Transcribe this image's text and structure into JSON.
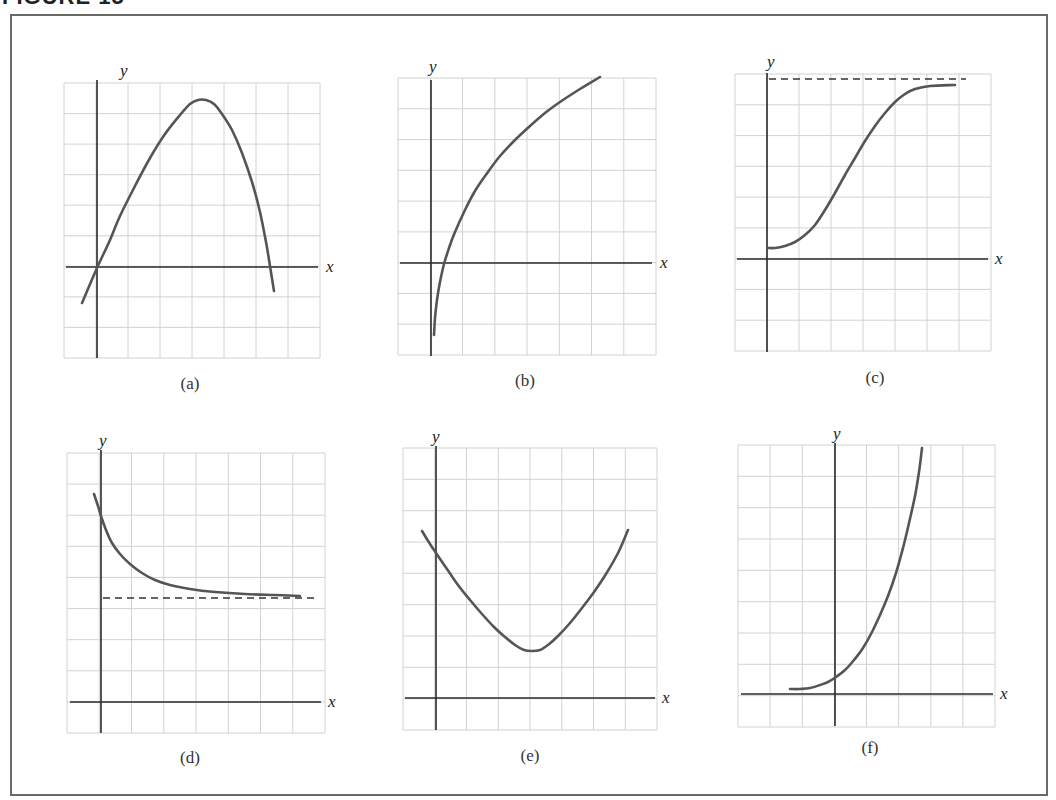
{
  "figure": {
    "title": "FIGURE 15",
    "axis_x_label": "x",
    "axis_y_label": "y",
    "colors": {
      "grid": "#d2d2d2",
      "axis": "#2a2a2a",
      "curve": "#555555",
      "dashed": "#333333",
      "caption": "#333333"
    }
  },
  "panels": [
    {
      "id": "a",
      "caption": "(a)",
      "grid": {
        "left": 64,
        "top": 83,
        "right": 320,
        "bottom": 358,
        "cols": 8,
        "rows": 9
      },
      "axes": {
        "yx": 97,
        "xy": 267,
        "xend": 318,
        "ytop": 80,
        "ybottom": 358,
        "xstart": 66
      },
      "labels": {
        "y": [
          120,
          76
        ],
        "x": [
          326,
          272
        ]
      },
      "caption_pos": [
        190,
        388
      ],
      "curve": [
        [
          82,
          303
        ],
        [
          97,
          268
        ],
        [
          110,
          240
        ],
        [
          120,
          216
        ],
        [
          135,
          186
        ],
        [
          150,
          158
        ],
        [
          165,
          134
        ],
        [
          180,
          115
        ],
        [
          190,
          104
        ],
        [
          198,
          100
        ],
        [
          206,
          100
        ],
        [
          214,
          104
        ],
        [
          222,
          114
        ],
        [
          232,
          130
        ],
        [
          242,
          153
        ],
        [
          252,
          182
        ],
        [
          260,
          212
        ],
        [
          266,
          242
        ],
        [
          270,
          266
        ],
        [
          274,
          291
        ]
      ]
    },
    {
      "id": "b",
      "caption": "(b)",
      "grid": {
        "left": 398,
        "top": 78,
        "right": 656,
        "bottom": 355,
        "cols": 8,
        "rows": 9
      },
      "axes": {
        "yx": 431,
        "xy": 263,
        "xend": 652,
        "ytop": 80,
        "ybottom": 356,
        "xstart": 400
      },
      "labels": {
        "y": [
          429,
          72
        ],
        "x": [
          660,
          268
        ]
      },
      "caption_pos": [
        525,
        385
      ],
      "curve": [
        [
          434,
          335
        ],
        [
          435,
          318
        ],
        [
          437,
          300
        ],
        [
          440,
          282
        ],
        [
          444,
          264
        ],
        [
          449,
          248
        ],
        [
          455,
          232
        ],
        [
          465,
          210
        ],
        [
          475,
          191
        ],
        [
          488,
          172
        ],
        [
          500,
          156
        ],
        [
          515,
          140
        ],
        [
          530,
          126
        ],
        [
          545,
          113
        ],
        [
          560,
          102
        ],
        [
          580,
          89
        ],
        [
          600,
          77
        ]
      ]
    },
    {
      "id": "c",
      "caption": "(c)",
      "grid": {
        "left": 735,
        "top": 74,
        "right": 991,
        "bottom": 351,
        "cols": 8,
        "rows": 9
      },
      "axes": {
        "yx": 767,
        "xy": 259,
        "xend": 988,
        "ytop": 73,
        "ybottom": 352,
        "xstart": 737
      },
      "labels": {
        "y": [
          767,
          67
        ],
        "x": [
          995,
          264
        ]
      },
      "caption_pos": [
        875,
        382
      ],
      "dashed": {
        "x1": 769,
        "x2": 966,
        "y": 79
      },
      "curve": [
        [
          768,
          248
        ],
        [
          775,
          248
        ],
        [
          785,
          246
        ],
        [
          795,
          242
        ],
        [
          805,
          235
        ],
        [
          815,
          225
        ],
        [
          825,
          210
        ],
        [
          835,
          193
        ],
        [
          845,
          175
        ],
        [
          855,
          158
        ],
        [
          865,
          141
        ],
        [
          875,
          126
        ],
        [
          885,
          113
        ],
        [
          895,
          102
        ],
        [
          905,
          94
        ],
        [
          915,
          89
        ],
        [
          930,
          86
        ],
        [
          955,
          85
        ]
      ]
    },
    {
      "id": "d",
      "caption": "(d)",
      "grid": {
        "left": 67,
        "top": 453,
        "right": 325,
        "bottom": 733,
        "cols": 8,
        "rows": 9
      },
      "axes": {
        "yx": 101,
        "xy": 702,
        "xend": 321,
        "ytop": 450,
        "ybottom": 733,
        "xstart": 70
      },
      "labels": {
        "y": [
          99,
          446
        ],
        "x": [
          328,
          707
        ]
      },
      "caption_pos": [
        190,
        762
      ],
      "dashed": {
        "x1": 103,
        "x2": 314,
        "y": 598
      },
      "curve": [
        [
          94,
          494
        ],
        [
          98,
          506
        ],
        [
          101,
          516
        ],
        [
          106,
          530
        ],
        [
          112,
          543
        ],
        [
          120,
          554
        ],
        [
          130,
          564
        ],
        [
          142,
          573
        ],
        [
          155,
          580
        ],
        [
          170,
          585
        ],
        [
          190,
          589
        ],
        [
          215,
          592
        ],
        [
          245,
          594
        ],
        [
          275,
          595
        ],
        [
          300,
          596
        ]
      ]
    },
    {
      "id": "e",
      "caption": "(e)",
      "grid": {
        "left": 403,
        "top": 448,
        "right": 657,
        "bottom": 730,
        "cols": 8,
        "rows": 9
      },
      "axes": {
        "yx": 436,
        "xy": 698,
        "xend": 655,
        "ytop": 446,
        "ybottom": 730,
        "xstart": 405
      },
      "labels": {
        "y": [
          432,
          442
        ],
        "x": [
          662,
          703
        ]
      },
      "caption_pos": [
        530,
        760
      ],
      "curve": [
        [
          422,
          531
        ],
        [
          430,
          544
        ],
        [
          436,
          553
        ],
        [
          447,
          569
        ],
        [
          458,
          585
        ],
        [
          470,
          600
        ],
        [
          482,
          614
        ],
        [
          494,
          627
        ],
        [
          505,
          637
        ],
        [
          515,
          645
        ],
        [
          524,
          650
        ],
        [
          532,
          651
        ],
        [
          540,
          650
        ],
        [
          548,
          645
        ],
        [
          558,
          636
        ],
        [
          570,
          623
        ],
        [
          582,
          608
        ],
        [
          594,
          592
        ],
        [
          606,
          574
        ],
        [
          618,
          553
        ],
        [
          628,
          530
        ]
      ]
    },
    {
      "id": "f",
      "caption": "(f)",
      "grid": {
        "left": 738,
        "top": 445,
        "right": 995,
        "bottom": 727,
        "cols": 8,
        "rows": 9
      },
      "axes": {
        "yx": 835,
        "xy": 694,
        "xend": 993,
        "ytop": 443,
        "ybottom": 726,
        "xstart": 741
      },
      "labels": {
        "y": [
          833,
          439
        ],
        "x": [
          1000,
          699
        ]
      },
      "caption_pos": [
        870,
        752
      ],
      "curve": [
        [
          790,
          689
        ],
        [
          800,
          689
        ],
        [
          810,
          688
        ],
        [
          820,
          685
        ],
        [
          828,
          682
        ],
        [
          836,
          677
        ],
        [
          845,
          670
        ],
        [
          854,
          660
        ],
        [
          863,
          648
        ],
        [
          872,
          632
        ],
        [
          880,
          615
        ],
        [
          888,
          596
        ],
        [
          896,
          573
        ],
        [
          903,
          548
        ],
        [
          909,
          523
        ],
        [
          915,
          496
        ],
        [
          919,
          472
        ],
        [
          922,
          448
        ]
      ]
    }
  ],
  "chart_data": [
    {
      "type": "line",
      "title": "(a)",
      "xlabel": "x",
      "ylabel": "y",
      "grid": true,
      "description": "Concave-down curve through origin; rises to a maximum then falls, crossing the x-axis again",
      "x": [
        -0.5,
        0,
        1,
        2,
        3.2,
        4,
        5,
        5.4
      ],
      "y": [
        -1.2,
        0,
        3.2,
        5.0,
        5.5,
        4.6,
        2.0,
        -0.8
      ],
      "xlim": [
        -1,
        7
      ],
      "ylim": [
        -3,
        6
      ]
    },
    {
      "type": "line",
      "title": "(b)",
      "xlabel": "x",
      "ylabel": "y",
      "grid": true,
      "description": "Logarithmic-type curve: vertical asymptote near y-axis, increasing and concave down",
      "x": [
        0.1,
        0.4,
        1,
        2,
        3,
        4,
        5.2
      ],
      "y": [
        -2.3,
        0,
        1.6,
        3.4,
        4.5,
        5.4,
        6.1
      ],
      "xlim": [
        -1,
        7
      ],
      "ylim": [
        -3,
        6
      ]
    },
    {
      "type": "line",
      "title": "(c)",
      "xlabel": "x",
      "ylabel": "y",
      "grid": true,
      "description": "Logistic (S-shaped) curve starting above origin, approaching horizontal asymptote (dashed)",
      "x": [
        0,
        1,
        2,
        3,
        4,
        5,
        6
      ],
      "y": [
        0.4,
        0.9,
        2.2,
        3.9,
        5.3,
        6.0,
        6.2
      ],
      "asymptote_y": 6.3,
      "xlim": [
        -1,
        7
      ],
      "ylim": [
        -3,
        6
      ]
    },
    {
      "type": "line",
      "title": "(d)",
      "xlabel": "x",
      "ylabel": "y",
      "grid": true,
      "description": "Decreasing concave-up curve approaching a horizontal asymptote (dashed) from above",
      "x": [
        -0.2,
        0,
        1,
        2,
        3,
        4,
        6.2
      ],
      "y": [
        6.3,
        5.9,
        4.1,
        3.5,
        3.3,
        3.2,
        3.15
      ],
      "asymptote_y": 3.1,
      "xlim": [
        -1,
        7
      ],
      "ylim": [
        -1,
        8
      ]
    },
    {
      "type": "line",
      "title": "(e)",
      "xlabel": "x",
      "ylabel": "y",
      "grid": true,
      "description": "Concave-up curve (U shape) with minimum near x=3",
      "x": [
        -0.5,
        0,
        1,
        2,
        3,
        4,
        5,
        6.2
      ],
      "y": [
        5.3,
        4.7,
        3.1,
        2.0,
        1.5,
        2.2,
        3.5,
        5.3
      ],
      "xlim": [
        -1,
        7
      ],
      "ylim": [
        -1,
        8
      ]
    },
    {
      "type": "line",
      "title": "(f)",
      "xlabel": "x",
      "ylabel": "y",
      "grid": true,
      "description": "Exponential growth curve: near zero on left, crosses y-axis slightly above origin, rapidly increasing",
      "x": [
        -1.5,
        -0.5,
        0,
        1,
        2,
        2.7
      ],
      "y": [
        0.2,
        0.3,
        0.6,
        1.9,
        4.5,
        8.0
      ],
      "xlim": [
        -3,
        5
      ],
      "ylim": [
        -1,
        8
      ]
    }
  ]
}
